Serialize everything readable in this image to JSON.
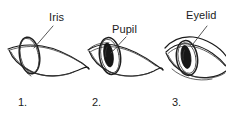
{
  "figure": {
    "background_color": "#ffffff",
    "ink_color": "#1a1a1a",
    "labels": [
      {
        "id": "iris",
        "text": "Iris"
      },
      {
        "id": "pupil",
        "text": "Pupil"
      },
      {
        "id": "eyelid",
        "text": "Eyelid"
      }
    ],
    "steps": [
      {
        "id": "step-1",
        "number": "1.",
        "caption": "1."
      },
      {
        "id": "step-2",
        "number": "2.",
        "caption": "2."
      },
      {
        "id": "step-3",
        "number": "3.",
        "caption": "3."
      }
    ]
  }
}
